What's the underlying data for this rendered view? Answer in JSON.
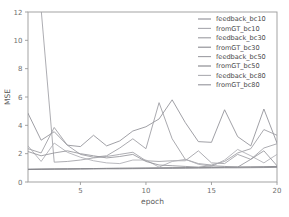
{
  "chart_data": {
    "type": "line",
    "title": "",
    "xlabel": "epoch",
    "ylabel": "MSE",
    "xlim": [
      1,
      20
    ],
    "ylim": [
      0,
      12
    ],
    "xticks": [
      5,
      10,
      15,
      20
    ],
    "yticks": [
      0,
      2,
      4,
      6,
      8,
      10,
      12
    ],
    "grid": false,
    "legend_position": "upper right",
    "x": [
      1,
      2,
      3,
      4,
      5,
      6,
      7,
      8,
      9,
      10,
      11,
      12,
      13,
      14,
      15,
      16,
      17,
      18,
      19,
      20
    ],
    "series": [
      {
        "name": "feedback_bc10",
        "color": "#8f8f96",
        "values": [
          4.85,
          2.95,
          3.55,
          2.6,
          2.5,
          3.3,
          2.55,
          2.9,
          3.6,
          3.9,
          4.45,
          5.8,
          4.2,
          2.85,
          2.8,
          5.1,
          3.2,
          2.55,
          5.15,
          2.75
        ]
      },
      {
        "name": "fromGT_bc10",
        "color": "#a8a8ae",
        "values": [
          0.9,
          0.92,
          0.93,
          0.94,
          0.95,
          0.95,
          0.96,
          0.97,
          0.97,
          0.98,
          0.99,
          1.0,
          1.0,
          1.01,
          1.02,
          1.03,
          1.04,
          1.05,
          1.06,
          1.08
        ]
      },
      {
        "name": "feedback_bc30",
        "color": "#9b9ba1",
        "values": [
          2.35,
          2.05,
          3.85,
          2.6,
          1.95,
          1.75,
          1.85,
          2.4,
          3.05,
          2.35,
          5.6,
          3.05,
          1.6,
          1.3,
          1.2,
          1.45,
          2.05,
          2.35,
          3.7,
          3.3
        ]
      },
      {
        "name": "fromGT_bc30",
        "color": "#8a8a90",
        "values": [
          0.88,
          0.89,
          0.9,
          0.9,
          0.91,
          0.92,
          0.93,
          0.93,
          0.94,
          0.95,
          0.96,
          0.96,
          0.97,
          0.98,
          0.99,
          1.0,
          1.0,
          1.01,
          1.02,
          1.03
        ]
      },
      {
        "name": "feedback_bc50",
        "color": "#9e9ea4",
        "values": [
          12.6,
          12.2,
          1.4,
          1.45,
          1.55,
          1.7,
          1.8,
          1.95,
          2.1,
          1.5,
          1.45,
          1.5,
          1.5,
          2.2,
          1.35,
          1.3,
          1.95,
          1.6,
          2.4,
          2.7
        ]
      },
      {
        "name": "fromGT_bc50",
        "color": "#848489",
        "values": [
          0.9,
          0.91,
          0.92,
          0.93,
          0.94,
          0.95,
          0.96,
          0.97,
          0.98,
          0.99,
          1.0,
          1.01,
          1.02,
          1.03,
          1.04,
          1.05,
          1.06,
          1.07,
          1.08,
          1.1
        ]
      },
      {
        "name": "feedback_bc80",
        "color": "#acacb2",
        "values": [
          2.55,
          1.45,
          2.75,
          2.1,
          1.75,
          1.5,
          1.35,
          1.3,
          1.55,
          1.55,
          1.05,
          1.45,
          1.6,
          1.25,
          1.1,
          1.55,
          2.3,
          1.85,
          1.35,
          1.95
        ]
      },
      {
        "name": "fromGT_bc80",
        "color": "#93939a",
        "values": [
          2.15,
          1.85,
          2.05,
          2.2,
          2.0,
          1.85,
          1.7,
          1.8,
          1.95,
          1.45,
          1.2,
          1.15,
          1.1,
          1.05,
          1.15,
          1.1,
          1.05,
          1.6,
          2.2,
          1.15
        ]
      }
    ]
  },
  "axes": {
    "xtick_labels": [
      "5",
      "10",
      "15",
      "20"
    ],
    "ytick_labels": [
      "0",
      "2",
      "4",
      "6",
      "8",
      "10",
      "12"
    ],
    "xlabel": "epoch",
    "ylabel": "MSE"
  },
  "legend": {
    "entries": [
      {
        "label": "feedback_bc10",
        "color": "#8f8f96"
      },
      {
        "label": "fromGT_bc10",
        "color": "#a8a8ae"
      },
      {
        "label": "feedback_bc30",
        "color": "#9b9ba1"
      },
      {
        "label": "fromGT_bc30",
        "color": "#8a8a90"
      },
      {
        "label": "feedback_bc50",
        "color": "#9e9ea4"
      },
      {
        "label": "fromGT_bc50",
        "color": "#848489"
      },
      {
        "label": "feedback_bc80",
        "color": "#acacb2"
      },
      {
        "label": "fromGT_bc80",
        "color": "#93939a"
      }
    ]
  }
}
